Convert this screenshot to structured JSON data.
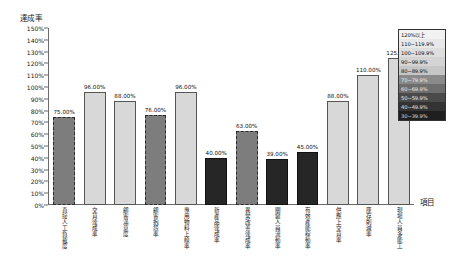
{
  "chart_data": {
    "type": "bar",
    "title": "",
    "ylabel": "達成率",
    "xlabel": "項目",
    "ylim": [
      0,
      150
    ],
    "ytick_step": 10,
    "grid": false,
    "legend_position": "top-right-inside",
    "yticks": [
      "150%",
      "140%",
      "130%",
      "120%",
      "110%",
      "100%",
      "90%",
      "80%",
      "70%",
      "60%",
      "50%",
      "40%",
      "30%",
      "20%",
      "10%",
      "0%"
    ],
    "categories": [
      "直接人工負載度",
      "交貨達成率",
      "顧客滿意度",
      "顧客抱怨率",
      "專用物料上線率",
      "新產品達成率",
      "異常改善達成率",
      "關鍵人員流動率",
      "有效產能稼動率",
      "供應上交貨率",
      "庫存削減率",
      "現場人員多能工"
    ],
    "values": [
      75.0,
      96.0,
      88.0,
      76.0,
      96.0,
      40.0,
      63.0,
      39.0,
      45.0,
      88.0,
      110.0,
      125.0
    ],
    "value_labels": [
      "75.00%",
      "96.00%",
      "88.00%",
      "76.00%",
      "96.00%",
      "40.00%",
      "63.00%",
      "39.00%",
      "45.00%",
      "88.00%",
      "110.00%",
      "125.00%"
    ],
    "bar_styles": [
      "mid",
      "light",
      "light",
      "mid",
      "light",
      "dark",
      "mid",
      "dark",
      "dark",
      "light",
      "light",
      "light"
    ],
    "legend": {
      "entries": [
        {
          "label": "120%以上",
          "color": "#f2f2f2",
          "text_color": "#111111"
        },
        {
          "label": "110~119.9%",
          "color": "#e8e8e8",
          "text_color": "#111111"
        },
        {
          "label": "100~109.9%",
          "color": "#dedede",
          "text_color": "#111111"
        },
        {
          "label": "90~99.9%",
          "color": "#d4d4d4",
          "text_color": "#111111"
        },
        {
          "label": "80~89.9%",
          "color": "#c6c6c6",
          "text_color": "#111111"
        },
        {
          "label": "70~79.9%",
          "color": "#8a8a8a",
          "text_color": "#e9e9e9"
        },
        {
          "label": "60~69.9%",
          "color": "#6e6e6e",
          "text_color": "#e9e9e9"
        },
        {
          "label": "50~59.9%",
          "color": "#4a4a4a",
          "text_color": "#e9e9e9"
        },
        {
          "label": "40~49.9%",
          "color": "#333333",
          "text_color": "#e0e0e0"
        },
        {
          "label": "30~39.9%",
          "color": "#1f1f1f",
          "text_color": "#dcdcdc"
        }
      ]
    },
    "colors": {
      "light_bar": "#d8d8d8",
      "mid_bar": "#7d7d7d",
      "dark_bar": "#262626",
      "axis": "#6b6b6b",
      "text": "#1a1a1a"
    }
  }
}
